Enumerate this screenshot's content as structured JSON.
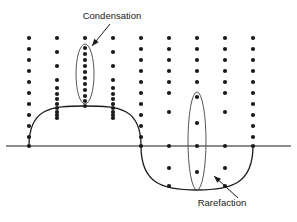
{
  "figure": {
    "background_color": "#ffffff",
    "ink_color": "#1a1a1a",
    "width": 297,
    "height": 222
  },
  "annotations": {
    "condensation": {
      "label": "Condensation",
      "text_x": 112,
      "text_y": 19,
      "arrow_from_x": 110,
      "arrow_from_y": 24,
      "arrow_to_x": 92,
      "arrow_to_y": 46,
      "highlight_cx": 85,
      "highlight_cy": 74,
      "highlight_rx": 9,
      "highlight_ry": 30
    },
    "rarefaction": {
      "label": "Rarefaction",
      "text_x": 222,
      "text_y": 206,
      "arrow_from_x": 238,
      "arrow_from_y": 198,
      "arrow_to_x": 214,
      "arrow_to_y": 176,
      "highlight_cx": 197,
      "highlight_cy": 141,
      "highlight_rx": 9,
      "highlight_ry": 49
    }
  },
  "axis": {
    "name": "equilibrium-axis",
    "x1": 6,
    "y1": 146,
    "x2": 291,
    "y2": 146
  },
  "wave": {
    "type": "displacement-curve",
    "description": "One full sine-like cycle: positive hump on the left, negative trough on the right",
    "zero_crossings_x": [
      29,
      141,
      253
    ],
    "crest_x": 85,
    "crest_y": 106,
    "trough_x": 197,
    "trough_y": 190,
    "path": "M 29 146 C 29 108 51 106 85 106 C 119 106 141 108 141 146 C 141 184 163 190 197 190 C 231 190 253 184 253 146"
  },
  "chart_data": {
    "type": "scatter",
    "xlabel": "",
    "ylabel": "",
    "grid": false,
    "legend": "none",
    "columns": [
      {
        "name": "column-1",
        "x": 29,
        "density": "uniform",
        "dot_count": 11,
        "dots_y": [
          38,
          49,
          60,
          71,
          82,
          93,
          104,
          115,
          126,
          137,
          146
        ]
      },
      {
        "name": "column-2",
        "x": 57,
        "density": "compressing",
        "dot_count": 12,
        "dots_y": [
          38,
          52,
          66,
          80,
          88,
          94,
          99,
          104,
          108,
          112,
          115,
          118
        ]
      },
      {
        "name": "column-3-condensation",
        "x": 85,
        "density": "compressed",
        "dot_count": 12,
        "dots_y": [
          38,
          48,
          54,
          60,
          66,
          72,
          78,
          84,
          90,
          96,
          101,
          106
        ]
      },
      {
        "name": "column-4",
        "x": 113,
        "density": "compressing",
        "dot_count": 12,
        "dots_y": [
          38,
          52,
          66,
          80,
          88,
          94,
          99,
          104,
          108,
          112,
          115,
          118
        ]
      },
      {
        "name": "column-5",
        "x": 141,
        "density": "uniform",
        "dot_count": 11,
        "dots_y": [
          38,
          49,
          60,
          71,
          82,
          93,
          104,
          115,
          126,
          137,
          146
        ]
      },
      {
        "name": "column-6",
        "x": 169,
        "density": "rarefying",
        "dot_count": 10,
        "dots_y": [
          38,
          49,
          60,
          71,
          82,
          93,
          112,
          146,
          168,
          186
        ]
      },
      {
        "name": "column-7-rarefaction",
        "x": 197,
        "density": "rarefied",
        "dot_count": 9,
        "dots_y": [
          38,
          49,
          60,
          71,
          82,
          97,
          123,
          146,
          172
        ]
      },
      {
        "name": "column-8",
        "x": 225,
        "density": "rarefying",
        "dot_count": 10,
        "dots_y": [
          38,
          49,
          60,
          71,
          82,
          93,
          112,
          146,
          168,
          186
        ]
      },
      {
        "name": "column-9",
        "x": 253,
        "density": "uniform",
        "dot_count": 11,
        "dots_y": [
          38,
          49,
          60,
          71,
          82,
          93,
          104,
          115,
          126,
          137,
          146
        ]
      }
    ]
  }
}
